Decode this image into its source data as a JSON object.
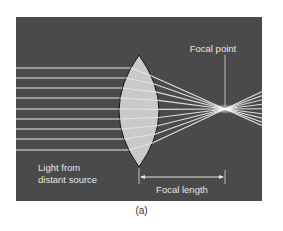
{
  "figure": {
    "caption": "(a)",
    "colors": {
      "panel_background": "#4a4a4a",
      "lens_fill": "#c9c9c9",
      "lens_outline": "#111111",
      "ray": "#e8e8e8",
      "label_text": "#e6e6e6",
      "annotation_line": "#d8d8d8"
    },
    "panel": {
      "x": 16,
      "y": 17,
      "width": 246,
      "height": 184
    },
    "lens": {
      "center_x": 139,
      "top_y": 55,
      "bottom_y": 167,
      "half_width": 20
    },
    "focal_point": {
      "x": 225,
      "y": 109
    },
    "incoming_ray_ys": [
      68,
      78,
      88,
      98,
      109,
      119,
      129,
      139,
      150
    ],
    "labels": {
      "focal_point": "Focal point",
      "source_line1": "Light from",
      "source_line2": "distant source",
      "focal_length": "Focal length"
    }
  }
}
